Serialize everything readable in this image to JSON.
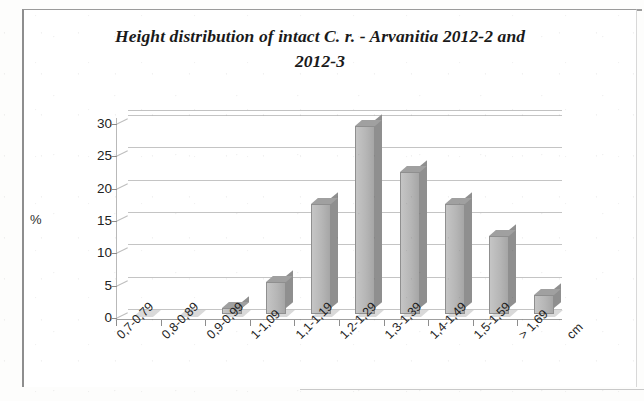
{
  "figure": {
    "title": "Height distribution of intact C. r. - Arvanitia 2012-2 and 2012-3",
    "title_line1": "Height distribution of intact C. r. - Arvanitia 2012-2 and",
    "title_line2": "2012-3"
  },
  "axes": {
    "y_axis_label": "%",
    "x_axis_unit": "cm",
    "y_ticks": [
      "0",
      "5",
      "10",
      "15",
      "20",
      "25",
      "30"
    ]
  },
  "chart_data": {
    "type": "bar",
    "title": "Height distribution of intact C. r. - Arvanitia 2012-2 and 2012-3",
    "subtitle": "",
    "xlabel": "cm",
    "ylabel": "%",
    "categories": [
      "0,7-0,79",
      "0,8-0,89",
      "0,9-0,99",
      "1-1,09",
      "1,1-1,19",
      "1,2-1,29",
      "1,3-1,39",
      "1,4-1,49",
      "1,5-1,59",
      "> 1,69"
    ],
    "values": [
      0,
      0,
      1,
      5,
      17,
      29,
      22,
      17,
      12,
      3
    ],
    "ylim": [
      0,
      30
    ],
    "ytick_step": 5,
    "grid": true,
    "legend": "none",
    "bar_color": "#b9b9b9",
    "style": "3d-column"
  }
}
